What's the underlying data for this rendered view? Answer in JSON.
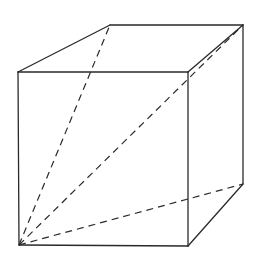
{
  "diagram": {
    "type": "cube-wireframe",
    "colors": {
      "background": "#ffffff",
      "line": "#2a2a2a"
    },
    "vertices": {
      "front_top_left": [
        18,
        72
      ],
      "front_top_right": [
        188,
        72
      ],
      "front_bottom_left": [
        19,
        245
      ],
      "front_bottom_right": [
        188,
        246
      ],
      "back_top_left": [
        110,
        25
      ],
      "back_top_right": [
        243,
        25
      ],
      "back_bottom_right": [
        243,
        184
      ]
    },
    "solid_edges": [
      [
        "front_top_left",
        "front_top_right"
      ],
      [
        "front_top_right",
        "front_bottom_right"
      ],
      [
        "front_bottom_right",
        "front_bottom_left"
      ],
      [
        "front_bottom_left",
        "front_top_left"
      ],
      [
        "front_top_left",
        "back_top_left"
      ],
      [
        "back_top_left",
        "back_top_right"
      ],
      [
        "back_top_right",
        "front_top_right"
      ],
      [
        "back_top_right",
        "back_bottom_right"
      ],
      [
        "back_bottom_right",
        "front_bottom_right"
      ]
    ],
    "dashed_diagonals": [
      [
        "front_bottom_left",
        "back_top_left"
      ],
      [
        "front_bottom_left",
        "back_top_right"
      ],
      [
        "front_bottom_left",
        "back_bottom_right"
      ]
    ]
  }
}
